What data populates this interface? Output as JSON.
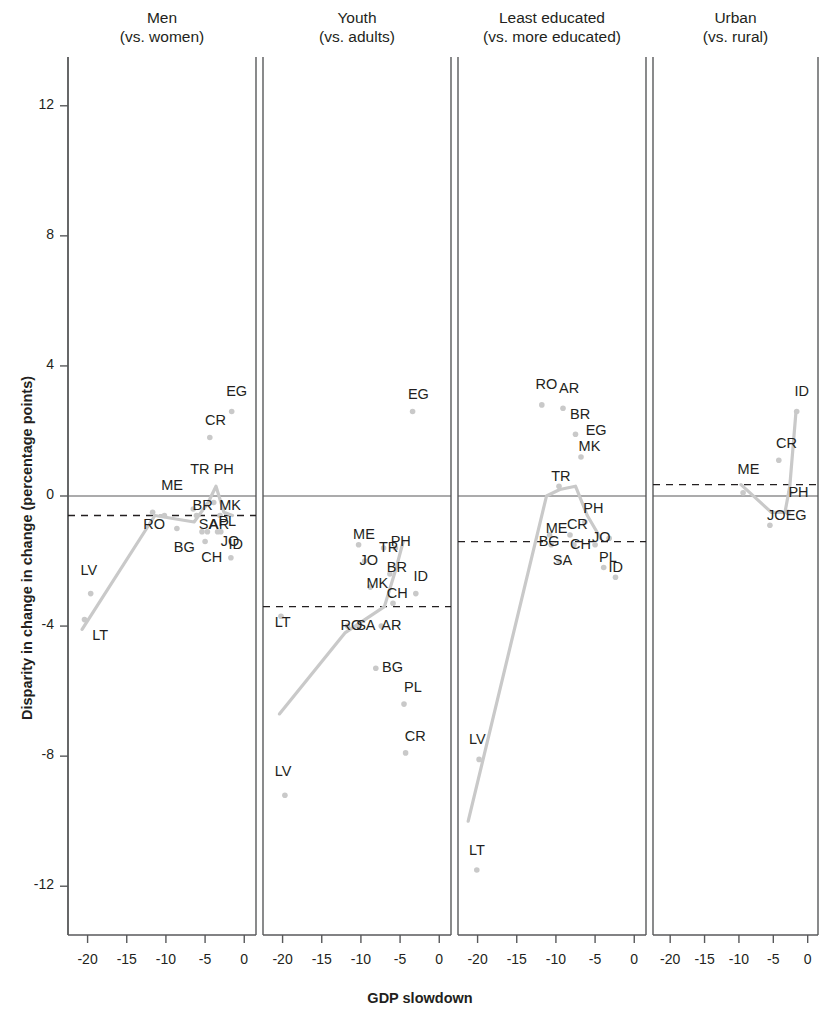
{
  "figure": {
    "x_axis_title": "GDP slowdown",
    "y_axis_title": "Disparity in change in change (percentage points)",
    "y_ticks": [
      "12",
      "8",
      "4",
      "0",
      "-4",
      "-8",
      "-12"
    ],
    "y_tick_values": [
      12,
      8,
      4,
      0,
      -4,
      -8,
      -12
    ],
    "x_ticks": [
      "-20",
      "-15",
      "-10",
      "-5",
      "0"
    ],
    "x_tick_values": [
      -20,
      -15,
      -10,
      -5,
      0
    ],
    "point_color": "#c9c9c9",
    "line_color": "#c9c9c9",
    "axis_color": "#58595b",
    "text_color": "#231f20"
  },
  "chart_data": {
    "type": "scatter",
    "title": "",
    "xlabel": "GDP slowdown",
    "ylabel": "Disparity in change in change (percentage points)",
    "xlim": [
      -22.5,
      1.5
    ],
    "ylim": [
      -13.5,
      13.5
    ],
    "grid": false,
    "legend": "none",
    "reference_line_zero": 0,
    "panels": [
      {
        "title_line1": "Men",
        "title_line2": "(vs. women)",
        "dashed_mean": -0.6,
        "points": [
          {
            "code": "LT",
            "x": -20.4,
            "y": -3.8
          },
          {
            "code": "LV",
            "x": -19.6,
            "y": -3.0
          },
          {
            "code": "RO",
            "x": -11.7,
            "y": -0.5
          },
          {
            "code": "ME",
            "x": -10.2,
            "y": -0.6
          },
          {
            "code": "BG",
            "x": -8.6,
            "y": -1.0
          },
          {
            "code": "TR",
            "x": -6.5,
            "y": -0.4
          },
          {
            "code": "BR",
            "x": -6.1,
            "y": -0.6
          },
          {
            "code": "SA",
            "x": -5.4,
            "y": -1.1
          },
          {
            "code": "CH",
            "x": -5.0,
            "y": -1.4
          },
          {
            "code": "AR",
            "x": -4.7,
            "y": -1.1
          },
          {
            "code": "CR",
            "x": -4.4,
            "y": 1.8
          },
          {
            "code": "PH",
            "x": -3.9,
            "y": -0.2
          },
          {
            "code": "PL",
            "x": -3.4,
            "y": -1.1
          },
          {
            "code": "MK",
            "x": -3.1,
            "y": -0.6
          },
          {
            "code": "JO",
            "x": -3.0,
            "y": -1.1
          },
          {
            "code": "EG",
            "x": -1.6,
            "y": 2.6
          },
          {
            "code": "ID",
            "x": -1.7,
            "y": -1.9
          }
        ],
        "fit_line": [
          {
            "x": -20.7,
            "y": -4.1
          },
          {
            "x": -11.4,
            "y": -0.6
          },
          {
            "x": -6.4,
            "y": -0.8
          },
          {
            "x": -4.6,
            "y": -0.2
          },
          {
            "x": -3.6,
            "y": 0.3
          },
          {
            "x": -2.6,
            "y": -0.5
          },
          {
            "x": -1.5,
            "y": -0.6
          }
        ],
        "labels": [
          {
            "code": "LT",
            "lx": -19.4,
            "ly": -4.3
          },
          {
            "code": "LV",
            "lx": -20.9,
            "ly": -2.3
          },
          {
            "code": "RO",
            "lx": -12.9,
            "ly": -0.9
          },
          {
            "code": "ME",
            "lx": -10.6,
            "ly": 0.3
          },
          {
            "code": "BG",
            "lx": -9.0,
            "ly": -1.6
          },
          {
            "code": "TR",
            "lx": -6.9,
            "ly": 0.8
          },
          {
            "code": "BR",
            "lx": -6.6,
            "ly": -0.3
          },
          {
            "code": "SA",
            "lx": -5.8,
            "ly": -0.9
          },
          {
            "code": "CH",
            "lx": -5.5,
            "ly": -1.9
          },
          {
            "code": "AR",
            "lx": -4.5,
            "ly": -0.9
          },
          {
            "code": "CR",
            "lx": -5.0,
            "ly": 2.3
          },
          {
            "code": "PH",
            "lx": -3.9,
            "ly": 0.8
          },
          {
            "code": "PL",
            "lx": -3.3,
            "ly": -0.8
          },
          {
            "code": "MK",
            "lx": -3.2,
            "ly": -0.3
          },
          {
            "code": "JO",
            "lx": -3.0,
            "ly": -1.4
          },
          {
            "code": "EG",
            "lx": -2.3,
            "ly": 3.2
          },
          {
            "code": "ID",
            "lx": -2.0,
            "ly": -1.5
          }
        ]
      },
      {
        "title_line1": "Youth",
        "title_line2": "(vs. adults)",
        "dashed_mean": -3.4,
        "points": [
          {
            "code": "LV",
            "x": -19.7,
            "y": -9.2
          },
          {
            "code": "LT",
            "x": -20.2,
            "y": -3.7
          },
          {
            "code": "RO",
            "x": -11.7,
            "y": -4.0
          },
          {
            "code": "SA",
            "x": -10.3,
            "y": -4.0
          },
          {
            "code": "ME",
            "x": -10.3,
            "y": -1.5
          },
          {
            "code": "JO",
            "x": -9.5,
            "y": -2.0
          },
          {
            "code": "MK",
            "x": -8.8,
            "y": -2.8
          },
          {
            "code": "BG",
            "x": -8.1,
            "y": -5.3
          },
          {
            "code": "AR",
            "x": -7.4,
            "y": -4.0
          },
          {
            "code": "TR",
            "x": -7.1,
            "y": -1.6
          },
          {
            "code": "BR",
            "x": -6.3,
            "y": -2.4
          },
          {
            "code": "CH",
            "x": -5.9,
            "y": -3.3
          },
          {
            "code": "PH",
            "x": -5.6,
            "y": -1.6
          },
          {
            "code": "PL",
            "x": -4.5,
            "y": -6.4
          },
          {
            "code": "CR",
            "x": -4.3,
            "y": -7.9
          },
          {
            "code": "EG",
            "x": -3.4,
            "y": 2.6
          },
          {
            "code": "ID",
            "x": -3.0,
            "y": -3.0
          }
        ],
        "fit_line": [
          {
            "x": -20.4,
            "y": -6.7
          },
          {
            "x": -12.0,
            "y": -4.2
          },
          {
            "x": -7.0,
            "y": -3.4
          },
          {
            "x": -5.6,
            "y": -2.3
          },
          {
            "x": -4.6,
            "y": -1.4
          }
        ],
        "labels": [
          {
            "code": "LV",
            "lx": -21.0,
            "ly": -8.5
          },
          {
            "code": "LT",
            "lx": -21.0,
            "ly": -3.9
          },
          {
            "code": "RO",
            "lx": -12.6,
            "ly": -4.0
          },
          {
            "code": "SA",
            "lx": -10.6,
            "ly": -4.0
          },
          {
            "code": "ME",
            "lx": -11.0,
            "ly": -1.2
          },
          {
            "code": "JO",
            "lx": -10.2,
            "ly": -2.0
          },
          {
            "code": "MK",
            "lx": -9.3,
            "ly": -2.7
          },
          {
            "code": "BG",
            "lx": -7.3,
            "ly": -5.3
          },
          {
            "code": "AR",
            "lx": -7.4,
            "ly": -4.0
          },
          {
            "code": "TR",
            "lx": -7.7,
            "ly": -1.6
          },
          {
            "code": "BR",
            "lx": -6.7,
            "ly": -2.2
          },
          {
            "code": "CH",
            "lx": -6.7,
            "ly": -3.0
          },
          {
            "code": "PH",
            "lx": -6.2,
            "ly": -1.4
          },
          {
            "code": "PL",
            "lx": -4.5,
            "ly": -5.9
          },
          {
            "code": "CR",
            "lx": -4.4,
            "ly": -7.4
          },
          {
            "code": "EG",
            "lx": -4.0,
            "ly": 3.1
          },
          {
            "code": "ID",
            "lx": -3.3,
            "ly": -2.5
          }
        ]
      },
      {
        "title_line1": "Least educated",
        "title_line2": "(vs. more educated)",
        "dashed_mean": -1.4,
        "points": [
          {
            "code": "LT",
            "x": -20.1,
            "y": -11.5
          },
          {
            "code": "LV",
            "x": -19.8,
            "y": -8.1
          },
          {
            "code": "RO",
            "x": -11.8,
            "y": 2.8
          },
          {
            "code": "ME",
            "x": -10.8,
            "y": -1.2
          },
          {
            "code": "BG",
            "x": -10.6,
            "y": -1.5
          },
          {
            "code": "TR",
            "x": -9.6,
            "y": 0.3
          },
          {
            "code": "SA",
            "x": -9.6,
            "y": -2.0
          },
          {
            "code": "AR",
            "x": -9.1,
            "y": 2.7
          },
          {
            "code": "CR",
            "x": -8.2,
            "y": -1.2
          },
          {
            "code": "CH",
            "x": -7.7,
            "y": -1.5
          },
          {
            "code": "BR",
            "x": -7.5,
            "y": 1.9
          },
          {
            "code": "MK",
            "x": -6.8,
            "y": 1.2
          },
          {
            "code": "PH",
            "x": -6.3,
            "y": -0.8
          },
          {
            "code": "JO",
            "x": -5.0,
            "y": -1.5
          },
          {
            "code": "PL",
            "x": -3.9,
            "y": -2.2
          },
          {
            "code": "EG",
            "x": -3.2,
            "y": -1.3
          },
          {
            "code": "ID",
            "x": -2.4,
            "y": -2.5
          }
        ],
        "fit_line": [
          {
            "x": -21.2,
            "y": -10.0
          },
          {
            "x": -11.2,
            "y": 0.0
          },
          {
            "x": -9.5,
            "y": 0.2
          },
          {
            "x": -7.5,
            "y": 0.3
          },
          {
            "x": -6.0,
            "y": -0.6
          },
          {
            "x": -4.3,
            "y": -1.3
          }
        ],
        "labels": [
          {
            "code": "LT",
            "lx": -21.1,
            "ly": -10.9
          },
          {
            "code": "LV",
            "lx": -21.1,
            "ly": -7.5
          },
          {
            "code": "RO",
            "lx": -12.6,
            "ly": 3.4
          },
          {
            "code": "ME",
            "lx": -11.3,
            "ly": -1.0
          },
          {
            "code": "BG",
            "lx": -12.2,
            "ly": -1.4
          },
          {
            "code": "TR",
            "lx": -10.6,
            "ly": 0.6
          },
          {
            "code": "SA",
            "lx": -10.4,
            "ly": -2.0
          },
          {
            "code": "AR",
            "lx": -9.6,
            "ly": 3.3
          },
          {
            "code": "CR",
            "lx": -8.6,
            "ly": -0.9
          },
          {
            "code": "CH",
            "lx": -8.2,
            "ly": -1.5
          },
          {
            "code": "BR",
            "lx": -8.2,
            "ly": 2.5
          },
          {
            "code": "MK",
            "lx": -7.1,
            "ly": 1.5
          },
          {
            "code": "PH",
            "lx": -6.5,
            "ly": -0.4
          },
          {
            "code": "JO",
            "lx": -5.4,
            "ly": -1.3
          },
          {
            "code": "PL",
            "lx": -4.5,
            "ly": -1.9
          },
          {
            "code": "EG",
            "lx": -6.2,
            "ly": 2.0
          },
          {
            "code": "ID",
            "lx": -3.3,
            "ly": -2.2
          }
        ]
      },
      {
        "title_line1": "Urban",
        "title_line2": "(vs. rural)",
        "dashed_mean": 0.35,
        "points": [
          {
            "code": "ME",
            "x": -9.4,
            "y": 0.1
          },
          {
            "code": "JO",
            "x": -5.5,
            "y": -0.9
          },
          {
            "code": "CR",
            "x": -4.2,
            "y": 1.1
          },
          {
            "code": "EG",
            "x": -2.9,
            "y": -0.5
          },
          {
            "code": "PH",
            "x": -2.6,
            "y": 0.1
          },
          {
            "code": "ID",
            "x": -1.6,
            "y": 2.6
          }
        ],
        "fit_line": [
          {
            "x": -9.7,
            "y": 0.35
          },
          {
            "x": -5.3,
            "y": -0.5
          },
          {
            "x": -3.3,
            "y": -0.5
          },
          {
            "x": -2.6,
            "y": 0.3
          },
          {
            "x": -1.7,
            "y": 2.6
          }
        ],
        "labels": [
          {
            "code": "ME",
            "lx": -10.2,
            "ly": 0.8
          },
          {
            "code": "JO",
            "lx": -5.9,
            "ly": -0.6
          },
          {
            "code": "CR",
            "lx": -4.6,
            "ly": 1.6
          },
          {
            "code": "EG",
            "lx": -3.2,
            "ly": -0.6
          },
          {
            "code": "PH",
            "lx": -2.8,
            "ly": 0.1
          },
          {
            "code": "ID",
            "lx": -1.9,
            "ly": 3.2
          }
        ]
      }
    ]
  }
}
